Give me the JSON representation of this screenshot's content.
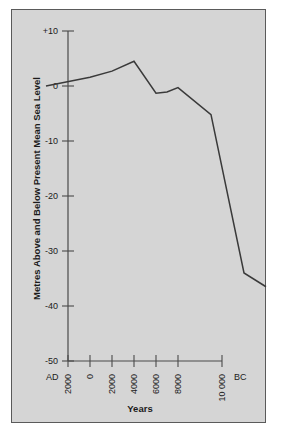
{
  "chart_data": {
    "type": "line",
    "title": "",
    "xlabel": "Years",
    "ylabel": "Metres Above and Below Present Mean Sea Level",
    "ylim": [
      -50,
      10
    ],
    "xlim_years_bp_label": [
      "AD 2000",
      "BC 10 000"
    ],
    "grid": false,
    "legend": "none",
    "y_ticks": [
      "+10",
      "0",
      "-10",
      "-20",
      "-30",
      "-40",
      "-50"
    ],
    "y_tick_values": [
      10,
      0,
      -10,
      -20,
      -30,
      -40,
      -50
    ],
    "x_ticks": [
      "2000",
      "0",
      "2000",
      "4000",
      "6000",
      "8000",
      "10 000"
    ],
    "x_tick_values": [
      -2000,
      0,
      2000,
      4000,
      6000,
      8000,
      10000
    ],
    "era_left": "AD",
    "era_right": "BC",
    "series": [
      {
        "name": "Sea level",
        "x": [
          -2000,
          0,
          1000,
          2000,
          3000,
          3500,
          4000,
          5500,
          7000,
          8000
        ],
        "values": [
          0.0,
          1.6,
          2.7,
          4.5,
          -1.3,
          -1.1,
          -0.3,
          -5.2,
          -34.0,
          -36.5
        ]
      }
    ],
    "annotations": [
      {
        "name": "axis-dot-marker",
        "x": 9000,
        "y": -50,
        "label": ""
      }
    ]
  }
}
